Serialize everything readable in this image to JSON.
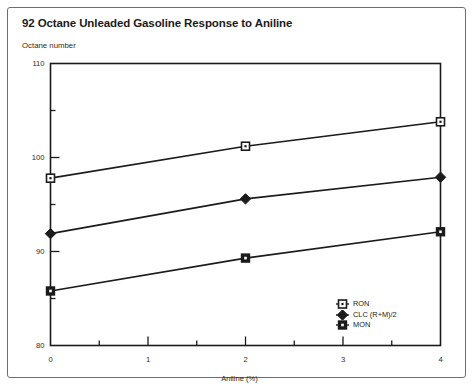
{
  "figure": {
    "title": "92 Octane Unleaded Gasoline Response to Aniline",
    "frame_color": "#6e6e6e",
    "background": "#ffffff",
    "line_color": "#1b1b1b"
  },
  "chart_data": {
    "type": "line",
    "title": "92 Octane Unleaded Gasoline Response to Aniline",
    "xlabel": "Aniline (%)",
    "ylabel": "Octane number",
    "xlim": [
      0,
      4
    ],
    "ylim": [
      80,
      110
    ],
    "grid": false,
    "legend_position": "lower-right-inside",
    "x_major_ticks": [
      0,
      1,
      2,
      3,
      4
    ],
    "x_minor_ticks": [
      0.5,
      1.5,
      2.5,
      3.5
    ],
    "x_tick_labels": [
      "0",
      "1",
      "2",
      "3",
      "4"
    ],
    "y_major_ticks": [
      80,
      90,
      100,
      110
    ],
    "y_minor_ticks": [
      85,
      95,
      105
    ],
    "y_tick_labels": [
      "80",
      "90",
      "100",
      "110"
    ],
    "x": [
      0,
      2,
      4
    ],
    "series": [
      {
        "name": "RON",
        "marker": "open-square",
        "values": [
          97.8,
          101.2,
          103.8
        ]
      },
      {
        "name": "CLC (R+M)/2",
        "marker": "filled-diamond",
        "values": [
          91.9,
          95.6,
          97.9
        ]
      },
      {
        "name": "MON",
        "marker": "filled-square",
        "values": [
          85.8,
          89.3,
          92.1
        ]
      }
    ],
    "legend": [
      {
        "label": "RON",
        "marker": "open-square"
      },
      {
        "label": "CLC (R+M)/2",
        "marker": "filled-diamond"
      },
      {
        "label": "MON",
        "marker": "filled-square"
      }
    ]
  }
}
